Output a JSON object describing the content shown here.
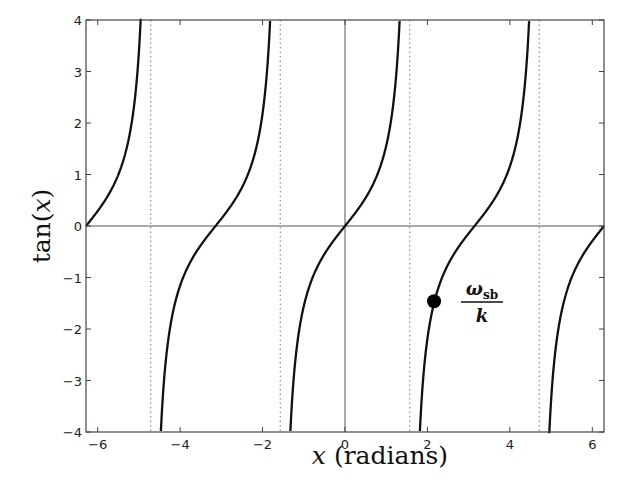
{
  "chart_data": {
    "type": "line",
    "title": "",
    "xlabel_var": "x",
    "xlabel_rest": " (radians)",
    "ylabel_fn": "tan(",
    "ylabel_var": "x",
    "ylabel_close": ")",
    "xlim": [
      -6.2832,
      6.2832
    ],
    "ylim": [
      -4,
      4
    ],
    "xticks": [
      -6,
      -4,
      -2,
      0,
      2,
      4,
      6
    ],
    "xtick_labels": [
      "−6",
      "−4",
      "−2",
      "0",
      "2",
      "4",
      "6"
    ],
    "yticks": [
      -4,
      -3,
      -2,
      -1,
      0,
      1,
      2,
      3,
      4
    ],
    "ytick_labels": [
      "−4",
      "−3",
      "−2",
      "−1",
      "0",
      "1",
      "2",
      "3",
      "4"
    ],
    "grid": false,
    "series": [
      {
        "name": "tan(x)",
        "function": "tan",
        "color": "#111111",
        "style": "solid"
      }
    ],
    "asymptotes": [
      -4.7124,
      -1.5708,
      1.5708,
      4.7124
    ],
    "asymptote_style": "dotted",
    "reference_lines": {
      "x": 0,
      "y": 0
    },
    "marker": {
      "x": 2.16,
      "y": -1.46,
      "label_num": "ω",
      "label_sub": "sb",
      "label_den": "k"
    }
  },
  "colors": {
    "curve": "#111111",
    "axes": "#555555",
    "asymptote": "#777777",
    "marker": "#000000"
  }
}
